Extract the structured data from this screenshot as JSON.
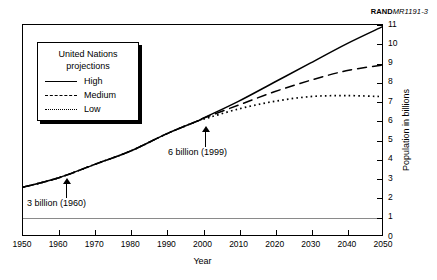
{
  "figure_id": {
    "brand": "RAND",
    "code": "MR1191-3"
  },
  "legend": {
    "title_line1": "United Nations",
    "title_line2": "projections",
    "items": [
      {
        "label": "High",
        "style": "solid"
      },
      {
        "label": "Medium",
        "style": "dashed"
      },
      {
        "label": "Low",
        "style": "dotted"
      }
    ]
  },
  "annotations": [
    {
      "text": "3 billion (1960)",
      "year": 1960,
      "value": 3
    },
    {
      "text": "6 billion (1999)",
      "year": 1999,
      "value": 6
    }
  ],
  "chart_data": {
    "type": "line",
    "title": "",
    "xlabel": "Year",
    "ylabel": "Population in billions",
    "xlim": [
      1950,
      2050
    ],
    "ylim": [
      0,
      11
    ],
    "xticks": [
      1950,
      1960,
      1970,
      1980,
      1990,
      2000,
      2010,
      2020,
      2030,
      2040,
      2050
    ],
    "yticks": [
      0,
      1,
      2,
      3,
      4,
      5,
      6,
      7,
      8,
      9,
      10,
      11
    ],
    "grid": "horizontal-line-at-1",
    "gridlines_y": [
      1
    ],
    "legend_position": "upper-left",
    "x": [
      1950,
      1960,
      1970,
      1980,
      1990,
      1999,
      2000,
      2010,
      2020,
      2030,
      2040,
      2050
    ],
    "series": [
      {
        "name": "High",
        "style": "solid",
        "values": [
          2.5,
          3.0,
          3.7,
          4.4,
          5.3,
          6.0,
          6.1,
          7.0,
          8.0,
          9.0,
          10.0,
          10.9
        ]
      },
      {
        "name": "Medium",
        "style": "dashed",
        "values": [
          2.5,
          3.0,
          3.7,
          4.4,
          5.3,
          6.0,
          6.1,
          6.8,
          7.5,
          8.1,
          8.6,
          8.9
        ]
      },
      {
        "name": "Low",
        "style": "dotted",
        "values": [
          2.5,
          3.0,
          3.7,
          4.4,
          5.3,
          6.0,
          6.05,
          6.6,
          7.0,
          7.25,
          7.3,
          7.25
        ]
      }
    ]
  }
}
